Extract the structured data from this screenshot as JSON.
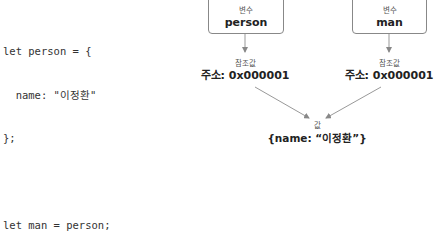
{
  "code": {
    "lines": [
      "let person = {",
      "  name: \"이정환\"",
      "};",
      "",
      "let man = person;"
    ]
  },
  "diagram": {
    "variables": [
      {
        "label": "변수",
        "name": "person"
      },
      {
        "label": "변수",
        "name": "man"
      }
    ],
    "references": [
      {
        "label": "참조값",
        "address": "주소: 0x000001"
      },
      {
        "label": "참조값",
        "address": "주소: 0x000001"
      }
    ],
    "value": {
      "label": "값",
      "content": "{name: “이정환”}"
    },
    "colors": {
      "arrow": "#999999",
      "box_border": "#888888"
    }
  }
}
